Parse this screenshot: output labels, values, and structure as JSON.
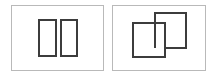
{
  "figure": {
    "width": 216,
    "height": 77,
    "background_color": "#ffffff",
    "frame_stroke_color": "#b9b9b9",
    "shape_stroke_color": "#3c3c3c",
    "shape_fill_color": "#ffffff"
  },
  "panels": [
    {
      "id": "panel-left",
      "label": "disjoint-rectangles-panel",
      "description": "Two separate non-overlapping vertical rectangles",
      "frame": {
        "x": 11,
        "y": 5,
        "width": 92,
        "height": 65
      },
      "shapes": [
        {
          "id": "left-rect-a",
          "name": "rectangle-a",
          "x": 39,
          "y": 20,
          "width": 17,
          "height": 36,
          "z": 1
        },
        {
          "id": "left-rect-b",
          "name": "rectangle-b",
          "x": 61,
          "y": 20,
          "width": 16,
          "height": 36,
          "z": 2
        }
      ]
    },
    {
      "id": "panel-right",
      "label": "overlapping-rectangles-panel",
      "description": "Two overlapping rectangles, the left-front one occluding part of the right-back one",
      "frame": {
        "x": 112,
        "y": 5,
        "width": 93,
        "height": 65
      },
      "shapes": [
        {
          "id": "right-rect-back",
          "name": "rectangle-back",
          "x": 155,
          "y": 13,
          "width": 31,
          "height": 35,
          "z": 1
        },
        {
          "id": "right-rect-front",
          "name": "rectangle-front",
          "x": 133,
          "y": 23,
          "width": 32,
          "height": 34,
          "z": 2
        }
      ]
    }
  ]
}
